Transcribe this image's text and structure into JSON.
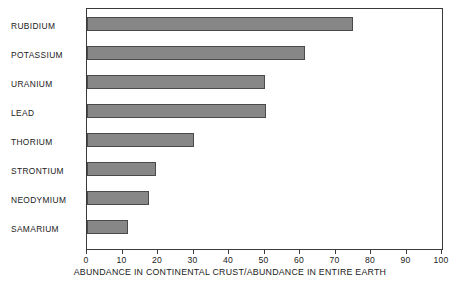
{
  "chart_data": {
    "type": "bar",
    "orientation": "horizontal",
    "title": "",
    "xlabel": "ABUNDANCE IN CONTINENTAL CRUST/ABUNDANCE IN ENTIRE EARTH",
    "ylabel": "",
    "xlim": [
      0,
      100
    ],
    "xticks": [
      0,
      10,
      20,
      30,
      40,
      50,
      60,
      70,
      80,
      90,
      100
    ],
    "xtick_labels": [
      "0",
      "10",
      "20",
      "30",
      "40",
      "50",
      "60",
      "70",
      "80",
      "90",
      "100"
    ],
    "grid": false,
    "legend": false,
    "bar_color": "#878787",
    "bar_edge_color": "#4a4a4a",
    "frame_color": "#3a3a3a",
    "categories": [
      "RUBIDIUM",
      "POTASSIUM",
      "URANIUM",
      "LEAD",
      "THORIUM",
      "STRONTIUM",
      "NEODYMIUM",
      "SAMARIUM"
    ],
    "values": [
      75,
      61.5,
      50,
      50.5,
      30,
      19.5,
      17.5,
      11.5
    ],
    "bars": [
      {
        "category": "RUBIDIUM",
        "value": 75
      },
      {
        "category": "POTASSIUM",
        "value": 61.5
      },
      {
        "category": "URANIUM",
        "value": 50
      },
      {
        "category": "LEAD",
        "value": 50.5
      },
      {
        "category": "THORIUM",
        "value": 30
      },
      {
        "category": "STRONTIUM",
        "value": 19.5
      },
      {
        "category": "NEODYMIUM",
        "value": 17.5
      },
      {
        "category": "SAMARIUM",
        "value": 11.5
      }
    ]
  }
}
